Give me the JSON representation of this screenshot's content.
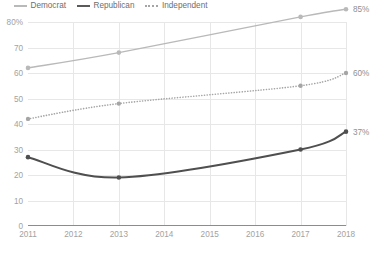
{
  "legend": {
    "items": [
      {
        "label": "Democrat",
        "style": "solid",
        "color": "#b9b9b9"
      },
      {
        "label": "Republican",
        "style": "solid",
        "color": "#5a5a5a"
      },
      {
        "label": "Independent",
        "style": "dotted",
        "color": "#a5a5a5"
      }
    ]
  },
  "chart_data": {
    "type": "line",
    "title": "",
    "xlabel": "",
    "ylabel": "",
    "x": [
      2011,
      2013,
      2017,
      2018
    ],
    "xlim": [
      2011,
      2018
    ],
    "ylim": [
      0,
      80
    ],
    "yticks": [
      0,
      10,
      20,
      30,
      40,
      50,
      60,
      70,
      80
    ],
    "ytick_labels": [
      "0",
      "10",
      "20",
      "30",
      "40",
      "50",
      "60",
      "70",
      "80%"
    ],
    "xticks": [
      2011,
      2012,
      2013,
      2014,
      2015,
      2016,
      2017,
      2018
    ],
    "xtick_labels": [
      "2011",
      "2012",
      "2013",
      "2014",
      "2015",
      "2016",
      "2017",
      "2018"
    ],
    "grid": true,
    "legend_position": "top-left",
    "series": [
      {
        "name": "Democrat",
        "color": "#b9b9b9",
        "style": "solid",
        "width": 1.4,
        "values": [
          62,
          68,
          82,
          85
        ],
        "end_label": "85%"
      },
      {
        "name": "Republican",
        "color": "#4f4f4f",
        "style": "solid",
        "width": 2.0,
        "values": [
          27,
          19,
          30,
          37
        ],
        "end_label": "37%"
      },
      {
        "name": "Independent",
        "color": "#a5a5a5",
        "style": "dotted",
        "width": 1.4,
        "values": [
          42,
          48,
          55,
          60
        ],
        "end_label": "60%"
      }
    ]
  }
}
